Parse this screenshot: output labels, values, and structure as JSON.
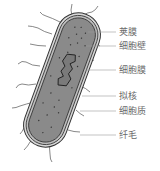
{
  "diagram": {
    "labels": [
      {
        "id": "capsule",
        "text": "荚膜",
        "x": 119,
        "y": 27,
        "line_from": [
          88,
          32
        ]
      },
      {
        "id": "cell-wall",
        "text": "细胞壁",
        "x": 119,
        "y": 42,
        "line_from": [
          88,
          46
        ]
      },
      {
        "id": "cell-membrane",
        "text": "细胞膜",
        "x": 119,
        "y": 66,
        "line_from": [
          88,
          70
        ]
      },
      {
        "id": "nucleoid",
        "text": "拟核",
        "x": 119,
        "y": 92,
        "line_from": [
          82,
          96
        ]
      },
      {
        "id": "cytoplasm",
        "text": "细胞质",
        "x": 119,
        "y": 107,
        "line_from": [
          80,
          111
        ]
      },
      {
        "id": "pili",
        "text": "纤毛",
        "x": 119,
        "y": 131,
        "line_from": [
          82,
          135
        ]
      }
    ],
    "colors": {
      "cytoplasm_fill": "#8a8a8a",
      "outline": "#333333",
      "capsule_fill": "#d0d0d0",
      "label_text": "#6a6a6a",
      "leader_line": "#9a9a9a"
    }
  }
}
